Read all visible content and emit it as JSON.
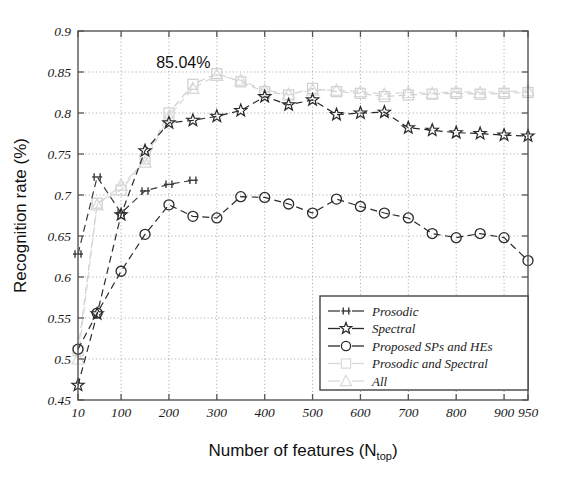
{
  "chart_data": {
    "type": "line",
    "title": "",
    "xlabel": "Number of features (N_top)",
    "xlabel_main": "Number of features (N",
    "xlabel_sub": "top",
    "xlabel_tail": ")",
    "ylabel": "Recognition rate (%)",
    "xlim": [
      10,
      950
    ],
    "ylim": [
      0.45,
      0.9
    ],
    "xticks": [
      10,
      100,
      200,
      300,
      400,
      500,
      600,
      700,
      800,
      900,
      950
    ],
    "xtick_labels": [
      "10",
      "100",
      "200",
      "300",
      "400",
      "500",
      "600",
      "700",
      "800",
      "900",
      "950"
    ],
    "yticks": [
      0.45,
      0.5,
      0.55,
      0.6,
      0.65,
      0.7,
      0.75,
      0.8,
      0.85,
      0.9
    ],
    "ytick_labels": [
      "0.45",
      "0.5",
      "0.55",
      "0.6",
      "0.65",
      "0.7",
      "0.75",
      "0.8",
      "0.85",
      "0.9"
    ],
    "grid": true,
    "grid_style": "dotted",
    "legend_position": "lower right",
    "annotations": [
      {
        "text": "85.04%",
        "x": 230,
        "y": 0.855
      }
    ],
    "x": [
      10,
      50,
      100,
      150,
      200,
      250,
      300,
      350,
      400,
      450,
      500,
      550,
      600,
      650,
      700,
      750,
      800,
      850,
      900,
      950
    ],
    "series": [
      {
        "name": "Prosodic",
        "marker": "plus-bar",
        "color": "#3a3a3a",
        "linestyle": "dashed",
        "x": [
          10,
          50,
          100,
          150,
          200,
          250
        ],
        "values": [
          0.628,
          0.722,
          0.678,
          0.705,
          0.713,
          0.718
        ]
      },
      {
        "name": "Spectral",
        "marker": "star",
        "color": "#2b2b2b",
        "linestyle": "dashed",
        "x": [
          10,
          50,
          100,
          150,
          200,
          250,
          300,
          350,
          400,
          450,
          500,
          550,
          600,
          650,
          700,
          750,
          800,
          850,
          900,
          950
        ],
        "values": [
          0.468,
          0.555,
          0.676,
          0.754,
          0.788,
          0.791,
          0.796,
          0.803,
          0.82,
          0.81,
          0.816,
          0.798,
          0.8,
          0.801,
          0.782,
          0.779,
          0.776,
          0.775,
          0.773,
          0.772
        ]
      },
      {
        "name": "Proposed SPs and HEs",
        "marker": "circle",
        "color": "#2b2b2b",
        "linestyle": "dashed",
        "x": [
          10,
          50,
          100,
          150,
          200,
          250,
          300,
          350,
          400,
          450,
          500,
          550,
          600,
          650,
          700,
          750,
          800,
          850,
          900,
          950
        ],
        "values": [
          0.512,
          0.556,
          0.607,
          0.652,
          0.688,
          0.674,
          0.672,
          0.698,
          0.697,
          0.689,
          0.678,
          0.695,
          0.686,
          0.678,
          0.672,
          0.653,
          0.648,
          0.653,
          0.648,
          0.62
        ]
      },
      {
        "name": "Prosodic and Spectral",
        "marker": "square",
        "color": "#cfcfcf",
        "linestyle": "dashed",
        "x": [
          10,
          50,
          100,
          150,
          200,
          250,
          300,
          350,
          400,
          450,
          500,
          550,
          600,
          650,
          700,
          750,
          800,
          850,
          900,
          950
        ],
        "values": [
          0.51,
          0.69,
          0.706,
          0.744,
          0.8,
          0.835,
          0.848,
          0.838,
          0.826,
          0.822,
          0.83,
          0.826,
          0.824,
          0.82,
          0.822,
          0.823,
          0.824,
          0.823,
          0.824,
          0.825
        ]
      },
      {
        "name": "All",
        "marker": "triangle",
        "color": "#d8d8d8",
        "linestyle": "dashed",
        "x": [
          10,
          50,
          100,
          150,
          200,
          250,
          300,
          350,
          400,
          450,
          500,
          550,
          600,
          650,
          700,
          750,
          800,
          850,
          900,
          950
        ],
        "values": [
          0.5,
          0.688,
          0.712,
          0.74,
          0.796,
          0.83,
          0.846,
          0.84,
          0.828,
          0.823,
          0.828,
          0.828,
          0.826,
          0.823,
          0.825,
          0.824,
          0.826,
          0.825,
          0.826,
          0.827
        ]
      }
    ]
  },
  "legend": {
    "items": [
      {
        "label": "Prosodic",
        "marker": "plus-bar",
        "color": "#3a3a3a",
        "show_line": true
      },
      {
        "label": "Spectral",
        "marker": "star",
        "color": "#2b2b2b",
        "show_line": true
      },
      {
        "label": "Proposed SPs and HEs",
        "marker": "circle",
        "color": "#2b2b2b",
        "show_line": true
      },
      {
        "label": "Prosodic and Spectral",
        "marker": "square",
        "color": "#d9d9d9",
        "show_line": true
      },
      {
        "label": "All",
        "marker": "triangle",
        "color": "#d9d9d9",
        "show_line": true
      }
    ]
  },
  "colors": {
    "axis": "#555555",
    "grid": "#999999",
    "background": "#ffffff",
    "text": "#111111"
  }
}
